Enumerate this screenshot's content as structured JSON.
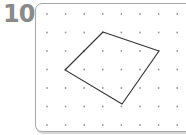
{
  "problem": {
    "number": "10"
  },
  "grid": {
    "origin": [
      47,
      14
    ],
    "spacing": [
      18.6,
      18.5
    ],
    "columns": 8,
    "rows": 7,
    "dot_color": "#9a9a9a"
  },
  "shape": {
    "type": "quadrilateral",
    "vertices_grid": [
      [
        3,
        1
      ],
      [
        6,
        2
      ],
      [
        4,
        5
      ],
      [
        1,
        3
      ]
    ],
    "vertices_px": [
      [
        103,
        32
      ],
      [
        159,
        51
      ],
      [
        122,
        104
      ],
      [
        65,
        70
      ]
    ],
    "stroke_color": "#333333"
  },
  "colors": {
    "label": "#8a8a8a",
    "border": "#a8a8a8"
  }
}
